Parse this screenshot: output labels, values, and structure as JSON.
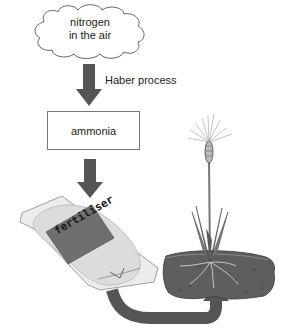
{
  "diagram": {
    "nodes": {
      "source": {
        "label_line1": "nitrogen",
        "label_line2": "in the air",
        "shape": "cloud"
      },
      "intermediate": {
        "label": "ammonia",
        "shape": "rectangle"
      },
      "product": {
        "label": "fertiliser",
        "shape": "bag"
      },
      "destination": {
        "label": "",
        "shape": "wheat-plant-in-soil"
      }
    },
    "edges": [
      {
        "from": "source",
        "to": "intermediate",
        "label": "Haber process"
      },
      {
        "from": "intermediate",
        "to": "product",
        "label": ""
      },
      {
        "from": "product",
        "to": "destination",
        "label": ""
      }
    ],
    "colors": {
      "arrow": "#555555",
      "soil": "#5e5e5e",
      "bag_label": "#6f6f6f",
      "bag": "#e6e6e6",
      "outline": "#777777"
    }
  }
}
